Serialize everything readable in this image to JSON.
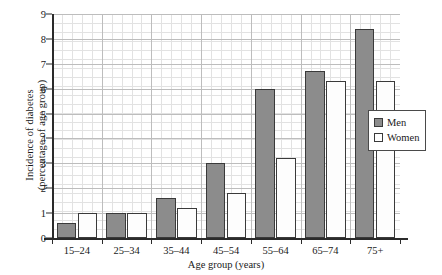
{
  "chart_data": {
    "type": "bar",
    "title": "",
    "subtitle": "",
    "xlabel": "Age group (years)",
    "ylabel": "Incidence of diabetes (percentage of age group)",
    "ylabel_lines": [
      "Incidence of diabetes",
      "(percentage of age group)"
    ],
    "categories": [
      "15–24",
      "25–34",
      "35–44",
      "45–54",
      "55–64",
      "65–74",
      "75+"
    ],
    "series": [
      {
        "name": "Men",
        "color": "#8c8c8c",
        "values": [
          0.6,
          1.0,
          1.6,
          3.0,
          6.0,
          6.7,
          8.4
        ]
      },
      {
        "name": "Women",
        "color": "#ffffff",
        "values": [
          1.0,
          1.0,
          1.2,
          1.8,
          3.2,
          6.3,
          6.3
        ]
      }
    ],
    "ylim": [
      0,
      9
    ],
    "ytick_values": [
      0,
      1,
      2,
      3,
      4,
      5,
      6,
      7,
      8,
      9
    ],
    "ytick_labels": [
      "0",
      "1",
      "2",
      "3",
      "4",
      "5",
      "6",
      "7",
      "8",
      "9"
    ],
    "grid": "minor-and-major",
    "legend_position": "right-inside",
    "legend_entries": [
      "Men",
      "Women"
    ]
  }
}
